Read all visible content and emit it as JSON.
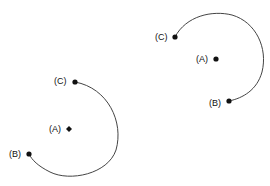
{
  "figures": [
    {
      "name": "left-arc",
      "labels": {
        "a": "(A)",
        "b": "(B)",
        "c": "(C)"
      }
    },
    {
      "name": "right-arc",
      "labels": {
        "a": "(A)",
        "b": "(B)",
        "c": "(C)"
      }
    }
  ],
  "colors": {
    "stroke": "#444444",
    "point": "#111111",
    "text": "#111111"
  }
}
